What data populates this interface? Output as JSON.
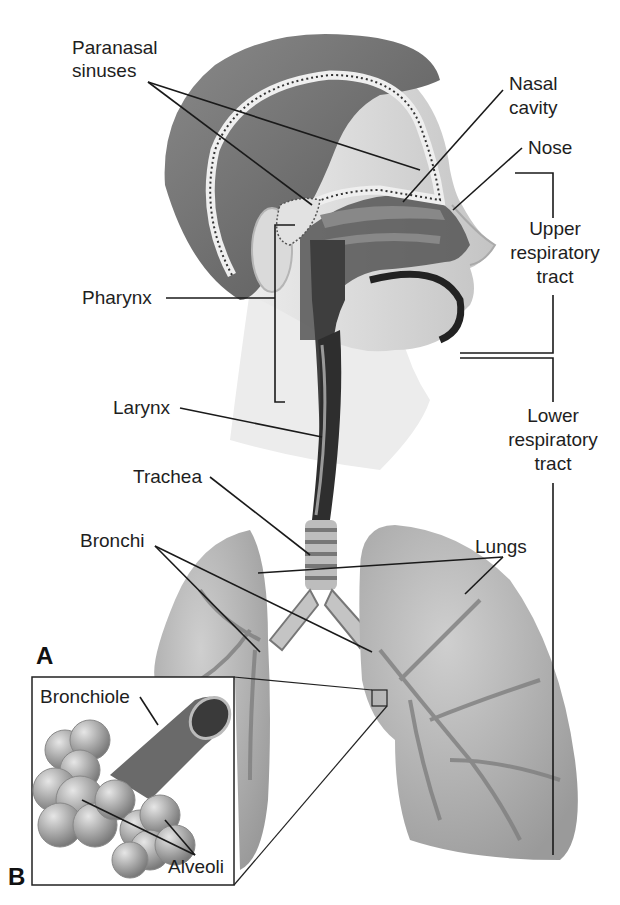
{
  "figure": {
    "panel_a_label": "A",
    "panel_b_label": "B"
  },
  "labels": {
    "paranasal_sinuses_1": "Paranasal",
    "paranasal_sinuses_2": "sinuses",
    "nasal_cavity_1": "Nasal",
    "nasal_cavity_2": "cavity",
    "nose": "Nose",
    "pharynx": "Pharynx",
    "larynx": "Larynx",
    "trachea": "Trachea",
    "bronchi": "Bronchi",
    "lungs": "Lungs",
    "bronchiole": "Bronchiole",
    "alveoli": "Alveoli"
  },
  "regions": {
    "upper_1": "Upper",
    "upper_2": "respiratory",
    "upper_3": "tract",
    "lower_1": "Lower",
    "lower_2": "respiratory",
    "lower_3": "tract"
  },
  "colors": {
    "background": "#ffffff",
    "line": "#1a1a1a",
    "hair": "#6e6e6e",
    "skin": "#d8d8d8",
    "airway": "#4a4a4a",
    "lung": "#a9a9a9",
    "vessel": "#7a7a7a"
  }
}
